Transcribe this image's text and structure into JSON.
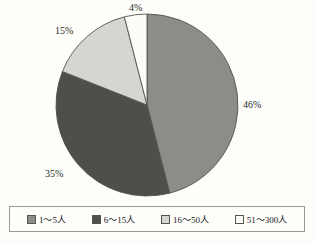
{
  "chart_data": {
    "type": "pie",
    "title": "",
    "categories": [
      "1〜5人",
      "6〜15人",
      "16〜50人",
      "51〜300人"
    ],
    "values": [
      46,
      35,
      15,
      4
    ],
    "value_labels": [
      "46%",
      "35%",
      "15%",
      "4%"
    ],
    "colors": [
      "#8d8d87",
      "#4f4e4a",
      "#d5d6cf",
      "#fdfdf7"
    ],
    "unit": "%",
    "start_angle_deg": 0,
    "direction": "clockwise",
    "legend_position": "bottom",
    "grid": false,
    "xlabel": "",
    "ylabel": ""
  },
  "legend": {
    "items": [
      {
        "label": "1〜5人",
        "color": "#8d8d87"
      },
      {
        "label": "6〜15人",
        "color": "#4f4e4a"
      },
      {
        "label": "16〜50人",
        "color": "#d5d6cf"
      },
      {
        "label": "51〜300人",
        "color": "#fdfdf7"
      }
    ]
  },
  "labels": {
    "slice_0": "46%",
    "slice_1": "35%",
    "slice_2": "15%",
    "slice_3": "4%"
  },
  "style": {
    "background": "#fdfdfa",
    "outline": "#55544f",
    "legend_border": "#9a9a94"
  }
}
